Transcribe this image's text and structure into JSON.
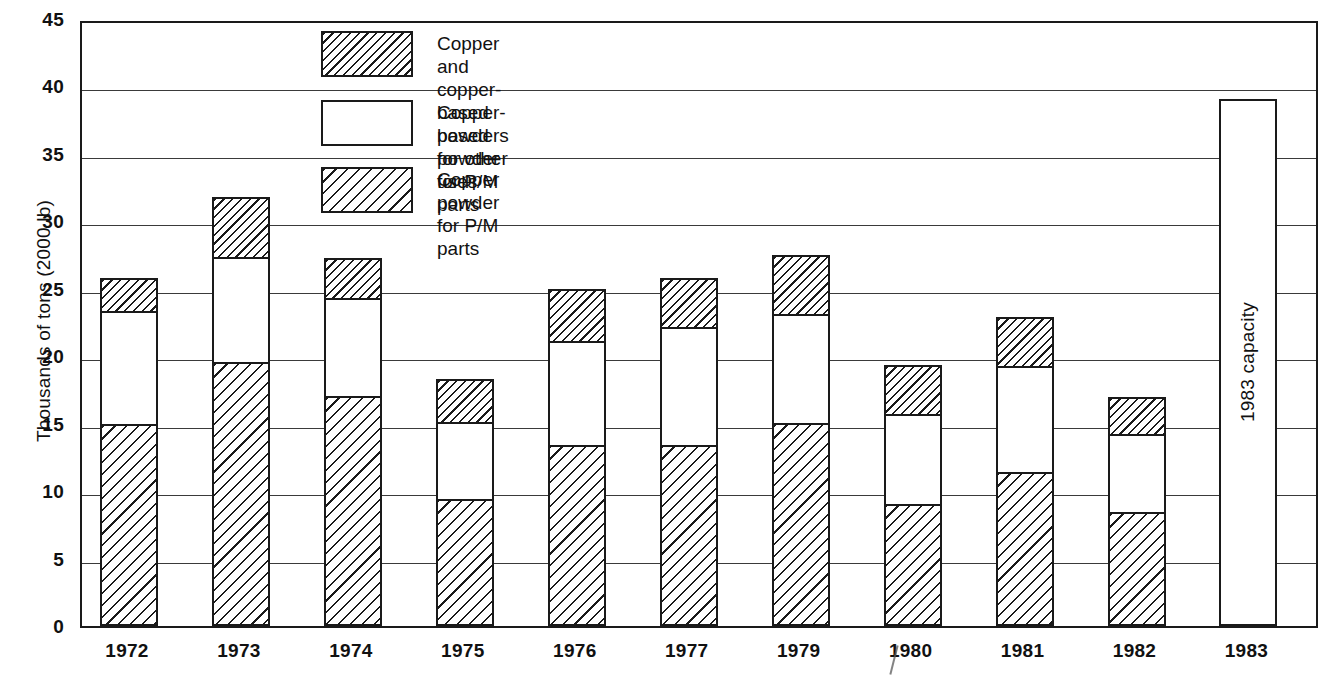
{
  "axes": {
    "y_title": "Thousands of tons (2000 lb)",
    "y_ticks": [
      "45",
      "40",
      "35",
      "30",
      "25",
      "20",
      "15",
      "10",
      "5",
      "0"
    ],
    "x_ticks": [
      "1972",
      "1973",
      "1974",
      "1975",
      "1976",
      "1977",
      "1979",
      "1980",
      "1981",
      "1982",
      "1983"
    ]
  },
  "legend": {
    "items": [
      {
        "label": "Copper and copper-based powders\nfor other uses",
        "pattern": "hatch-dense"
      },
      {
        "label": "Copper-based powder for P/M parts",
        "pattern": "plain"
      },
      {
        "label": "Copper powder for P/M parts",
        "pattern": "hatch-open"
      }
    ]
  },
  "annotations": {
    "capacity_bar_label": "1983 capacity"
  },
  "colors": {
    "ink": "#1a1a1a",
    "grid": "#3a3a3a",
    "background": "#ffffff"
  },
  "chart_data": {
    "type": "bar",
    "subtype": "stacked",
    "title": "",
    "xlabel": "",
    "ylabel": "Thousands of tons (2000 lb)",
    "ylim": [
      0,
      45
    ],
    "ytick_step": 5,
    "grid": true,
    "legend_position": "top-center-inside",
    "categories": [
      "1972",
      "1973",
      "1974",
      "1975",
      "1976",
      "1977",
      "1979",
      "1980",
      "1981",
      "1982",
      "1983"
    ],
    "series": [
      {
        "name": "Copper powder for P/M parts",
        "pattern": "hatch-open",
        "values": [
          14.8,
          19.4,
          16.9,
          9.3,
          13.3,
          13.3,
          14.9,
          8.9,
          11.3,
          8.3,
          0.0
        ]
      },
      {
        "name": "Copper-based powder for P/M parts",
        "pattern": "plain",
        "values": [
          8.4,
          7.8,
          7.3,
          5.7,
          7.7,
          8.7,
          8.1,
          6.7,
          7.8,
          5.8,
          38.9
        ]
      },
      {
        "name": "Copper and copper-based powders for other uses",
        "pattern": "hatch-dense",
        "values": [
          2.4,
          4.4,
          2.9,
          3.1,
          3.8,
          3.6,
          4.3,
          3.6,
          3.6,
          2.7,
          0.0
        ]
      }
    ],
    "segment_boundaries": {
      "1972": [
        14.8,
        23.2,
        25.6
      ],
      "1973": [
        19.4,
        27.2,
        31.6
      ],
      "1974": [
        16.9,
        24.2,
        27.1
      ],
      "1975": [
        9.3,
        15.0,
        18.1
      ],
      "1976": [
        13.3,
        21.0,
        24.8
      ],
      "1977": [
        13.3,
        22.0,
        25.6
      ],
      "1979": [
        14.9,
        23.0,
        27.3
      ],
      "1980": [
        8.9,
        15.6,
        19.2
      ],
      "1981": [
        11.3,
        19.1,
        22.7
      ],
      "1982": [
        8.3,
        14.1,
        16.8
      ],
      "1983": [
        0.0,
        38.9,
        38.9
      ]
    },
    "totals": [
      25.6,
      31.6,
      27.1,
      18.1,
      24.8,
      25.6,
      27.3,
      19.2,
      22.7,
      16.8,
      38.9
    ]
  }
}
